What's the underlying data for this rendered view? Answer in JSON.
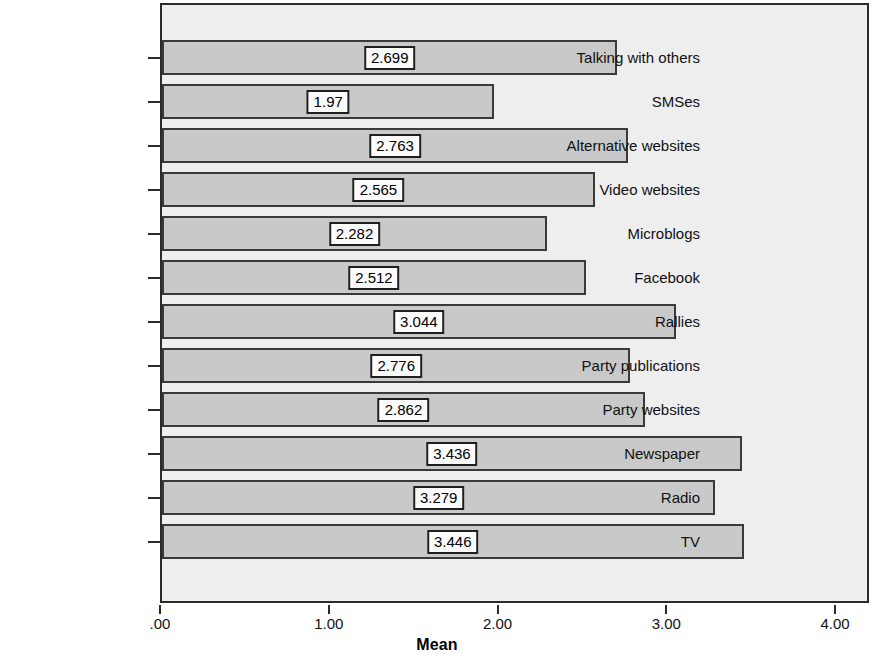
{
  "chart_data": {
    "type": "bar",
    "orientation": "horizontal",
    "title": "",
    "subtitle": "",
    "xlabel": "Mean",
    "ylabel": "",
    "xlim": [
      0,
      4
    ],
    "xticks": [
      0,
      1,
      2,
      3,
      4
    ],
    "xtick_labels": [
      ".00",
      "1.00",
      "2.00",
      "3.00",
      "4.00"
    ],
    "grid": false,
    "legend": false,
    "categories": [
      "Talking with others",
      "SMSes",
      "Alternative websites",
      "Video websites",
      "Microblogs",
      "Facebook",
      "Rallies",
      "Party publications",
      "Party websites",
      "Newspaper",
      "Radio",
      "TV"
    ],
    "values": [
      2.699,
      1.97,
      2.763,
      2.565,
      2.282,
      2.512,
      3.044,
      2.776,
      2.862,
      3.436,
      3.279,
      3.446
    ],
    "value_labels": [
      "2.699",
      "1.97",
      "2.763",
      "2.565",
      "2.282",
      "2.512",
      "3.044",
      "2.776",
      "2.862",
      "3.436",
      "3.279",
      "3.446"
    ],
    "colors": {
      "bar_fill": "#c9c9c9",
      "bar_border": "#3a3a3a",
      "plot_background": "#eeeeee",
      "frame": "#2b2b2b",
      "label_box_fill": "#fbfbfb",
      "label_box_border": "#1f1f1f",
      "text": "#111111"
    }
  }
}
